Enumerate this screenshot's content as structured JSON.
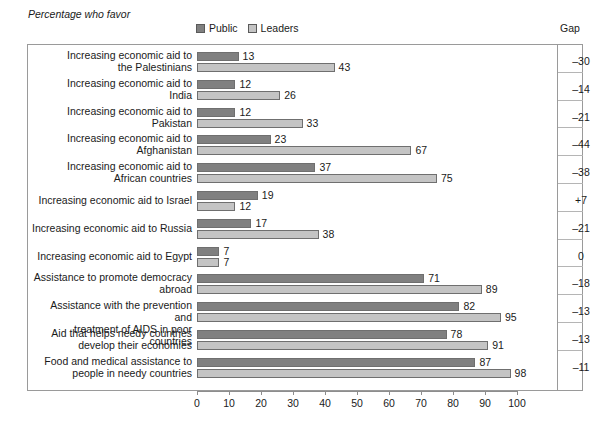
{
  "kicker": "Percentage who favor",
  "legend": {
    "public_label": "Public",
    "leaders_label": "Leaders",
    "public_color": "#808080",
    "leaders_color": "#c4c4c4"
  },
  "gap_column_header": "Gap",
  "chart_data": {
    "type": "bar",
    "title": "Percentage who favor",
    "xlabel": "",
    "ylabel": "",
    "orientation": "horizontal",
    "xlim": [
      0,
      100
    ],
    "xticks": [
      0,
      10,
      20,
      30,
      40,
      50,
      60,
      70,
      80,
      90,
      100
    ],
    "xtick_labels": [
      "0",
      "10",
      "20",
      "30",
      "40",
      "50",
      "60",
      "70",
      "80",
      "90",
      "100"
    ],
    "grid": false,
    "legend_position": "top-left",
    "categories": [
      "Increasing economic aid to the Palestinians",
      "Increasing economic aid to India",
      "Increasing economic aid to Pakistan",
      "Increasing economic aid to Afghanistan",
      "Increasing economic aid to African countries",
      "Increasing economic aid to Israel",
      "Increasing economic aid to Russia",
      "Increasing economic aid to Egypt",
      "Assistance to promote democracy abroad",
      "Assistance with the prevention and treatment of AIDS in poor countries",
      "Aid that helps needy countries develop their economies",
      "Food and medical assistance to people in needy countries"
    ],
    "series": [
      {
        "name": "Public",
        "values": [
          13,
          12,
          12,
          23,
          37,
          19,
          17,
          7,
          71,
          82,
          78,
          87
        ]
      },
      {
        "name": "Leaders",
        "values": [
          43,
          26,
          33,
          67,
          75,
          12,
          38,
          7,
          89,
          95,
          91,
          98
        ]
      }
    ],
    "gap": [
      -30,
      -14,
      -21,
      -44,
      -38,
      7,
      -21,
      0,
      -18,
      -13,
      -13,
      -11
    ]
  },
  "rows": [
    {
      "label_lines": [
        "Increasing economic aid to",
        "the Palestinians"
      ],
      "public": 13,
      "leaders": 43,
      "public_text": "13",
      "leaders_text": "43",
      "gap_text": "–30"
    },
    {
      "label_lines": [
        "Increasing economic aid to",
        "India"
      ],
      "public": 12,
      "leaders": 26,
      "public_text": "12",
      "leaders_text": "26",
      "gap_text": "–14"
    },
    {
      "label_lines": [
        "Increasing economic aid to",
        "Pakistan"
      ],
      "public": 12,
      "leaders": 33,
      "public_text": "12",
      "leaders_text": "33",
      "gap_text": "–21"
    },
    {
      "label_lines": [
        "Increasing economic aid to",
        "Afghanistan"
      ],
      "public": 23,
      "leaders": 67,
      "public_text": "23",
      "leaders_text": "67",
      "gap_text": "–44"
    },
    {
      "label_lines": [
        "Increasing economic aid to",
        "African countries"
      ],
      "public": 37,
      "leaders": 75,
      "public_text": "37",
      "leaders_text": "75",
      "gap_text": "–38"
    },
    {
      "label_lines": [
        "Increasing economic aid to Israel"
      ],
      "public": 19,
      "leaders": 12,
      "public_text": "19",
      "leaders_text": "12",
      "gap_text": "+7"
    },
    {
      "label_lines": [
        "Increasing economic aid to Russia"
      ],
      "public": 17,
      "leaders": 38,
      "public_text": "17",
      "leaders_text": "38",
      "gap_text": "–21"
    },
    {
      "label_lines": [
        "Increasing economic aid to Egypt"
      ],
      "public": 7,
      "leaders": 7,
      "public_text": "7",
      "leaders_text": "7",
      "gap_text": "0"
    },
    {
      "label_lines": [
        "Assistance to promote democracy",
        "abroad"
      ],
      "public": 71,
      "leaders": 89,
      "public_text": "71",
      "leaders_text": "89",
      "gap_text": "–18"
    },
    {
      "label_lines": [
        "Assistance with the prevention and",
        "treatment of AIDS in poor countries"
      ],
      "public": 82,
      "leaders": 95,
      "public_text": "82",
      "leaders_text": "95",
      "gap_text": "–13"
    },
    {
      "label_lines": [
        "Aid that helps needy countries",
        "develop their economies"
      ],
      "public": 78,
      "leaders": 91,
      "public_text": "78",
      "leaders_text": "91",
      "gap_text": "–13"
    },
    {
      "label_lines": [
        "Food and medical assistance to",
        "people in needy countries"
      ],
      "public": 87,
      "leaders": 98,
      "public_text": "87",
      "leaders_text": "98",
      "gap_text": "–11"
    }
  ],
  "axis": {
    "ticks": [
      "0",
      "10",
      "20",
      "30",
      "40",
      "50",
      "60",
      "70",
      "80",
      "90",
      "100"
    ]
  }
}
